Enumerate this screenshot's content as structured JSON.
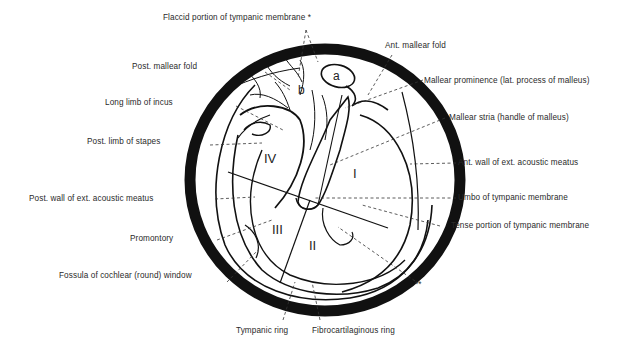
{
  "figure": {
    "labels": {
      "flaccid_portion": "Flaccid portion of tympanic membrane *",
      "ant_mallear_fold": "Ant. mallear fold",
      "mallear_prominence": "Mallear prominence (lat. process of malleus)",
      "mallear_stria": "Mallear stria (handle of malleus)",
      "ant_wall": "Ant. wall of ext. acoustic meatus",
      "umbo": "Umbo of tympanic membrane",
      "tense_portion": "Tense portion of tympanic membrane",
      "double_asterisk": "**",
      "post_mallear_fold": "Post. mallear fold",
      "long_limb_incus": "Long limb of incus",
      "post_limb_stapes": "Post. limb of stapes",
      "post_wall": "Post. wall of ext. acoustic meatus",
      "promontory": "Promontory",
      "fossula": "Fossula of cochlear (round) window",
      "tympanic_ring": "Tympanic ring",
      "fibrocartilaginous_ring": "Fibrocartilaginous ring"
    },
    "quadrants": {
      "q1": "I",
      "q2": "II",
      "q3": "III",
      "q4": "IV"
    },
    "sublabels": {
      "a": "a",
      "b": "b"
    },
    "colors": {
      "ink": "#111111",
      "label": "#2a2a2a",
      "background": "#ffffff"
    }
  }
}
